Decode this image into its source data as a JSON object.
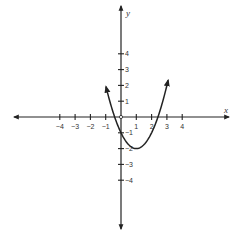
{
  "chart_data": {
    "type": "line",
    "title": "",
    "xlabel": "x",
    "ylabel": "y",
    "function": "y = x^2 - 2x - 1",
    "x_ticks": [
      -4,
      -3,
      -2,
      -1,
      1,
      2,
      3,
      4
    ],
    "y_ticks": [
      4,
      3,
      2,
      1,
      -1,
      -2,
      -3,
      -4
    ],
    "x_tick_labels": [
      "−4",
      "−3",
      "−2",
      "−1",
      "1",
      "2",
      "3",
      "4"
    ],
    "y_tick_labels": [
      "4",
      "3",
      "2",
      "1",
      "−1",
      "−2",
      "−3",
      "−4"
    ],
    "xlim": [
      -7.8,
      7.8
    ],
    "ylim": [
      -7.5,
      7.5
    ],
    "grid": false,
    "legend": null,
    "series": [
      {
        "name": "parabola",
        "x": [
          -1.0,
          -0.5,
          0,
          0.5,
          1,
          1.5,
          2,
          2.5,
          3,
          3.1
        ],
        "y": [
          2.0,
          0.25,
          -1,
          -1.75,
          -2,
          -1.75,
          -1,
          0.25,
          2,
          2.41
        ],
        "vertex": [
          1,
          -2
        ],
        "x_intercepts": [
          -0.41,
          2.41
        ],
        "y_intercept": -1,
        "arrows_at_ends": true
      }
    ],
    "origin_marker": "open-circle"
  },
  "axes": {
    "x_name": "x",
    "y_name": "y"
  }
}
